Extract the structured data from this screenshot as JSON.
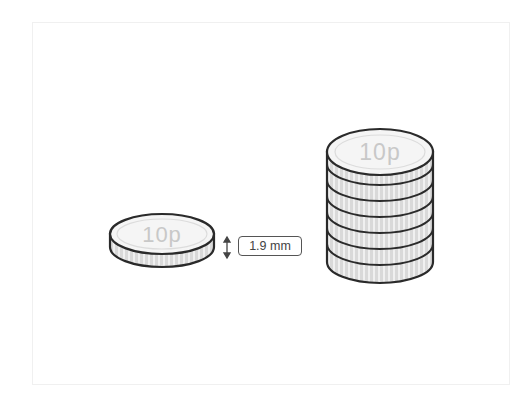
{
  "diagram": {
    "single_coin": {
      "denomination_label": "10p"
    },
    "measurement": {
      "thickness_label": "1.9 mm",
      "icon": "vertical-double-arrow-icon"
    },
    "coin_stack": {
      "denomination_label": "10p",
      "coin_count": 7
    },
    "colors": {
      "outline": "#2a2a2a",
      "face": "#f4f4f4",
      "edge": "#d9d9d9",
      "edge_ridge": "#f2f2f2",
      "text": "#c8c8c8",
      "frame_border": "#f0f0f0"
    }
  }
}
